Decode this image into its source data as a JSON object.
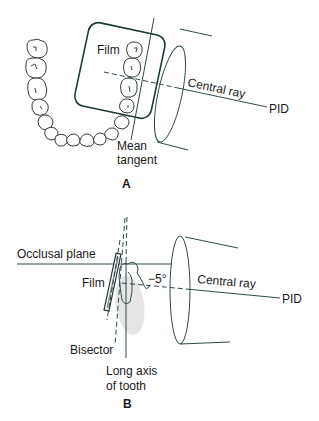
{
  "figure": {
    "panel_a": {
      "label": "A",
      "labels": {
        "film": "Film",
        "central_ray": "Central ray",
        "pid": "PID",
        "mean_tangent_line1": "Mean",
        "mean_tangent_line2": "tangent"
      }
    },
    "panel_b": {
      "label": "B",
      "labels": {
        "occlusal_plane": "Occlusal plane",
        "film": "Film",
        "angle": "−5°",
        "central_ray": "Central ray",
        "pid": "PID",
        "bisector": "Bisector",
        "long_axis_line1": "Long axis",
        "long_axis_line2": "of tooth"
      }
    },
    "colors": {
      "line": "#2f4a4a",
      "film_outline": "#1f3a36",
      "text": "#1a1a1a",
      "root_shade": "#e6e6e6"
    }
  }
}
